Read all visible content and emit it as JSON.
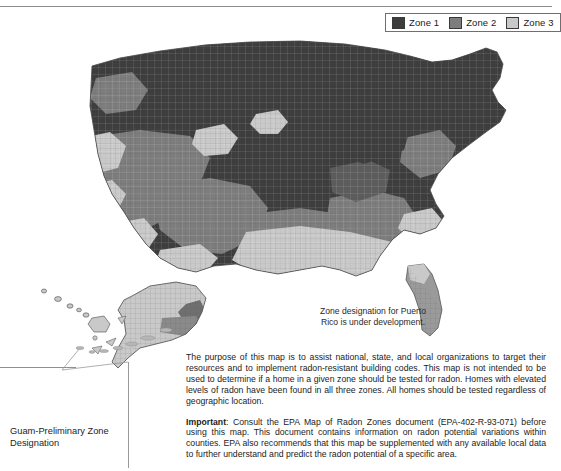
{
  "document": {
    "title": "EPA Map of Radon Zones"
  },
  "legend": {
    "items": [
      {
        "label": "Zone 1",
        "color": "#3d3d3d",
        "name": "zone-1"
      },
      {
        "label": "Zone 2",
        "color": "#7d7d7d",
        "name": "zone-2"
      },
      {
        "label": "Zone 3",
        "color": "#c9c9c9",
        "name": "zone-3"
      }
    ]
  },
  "notes": {
    "puerto_rico": "Zone designation for Puerto Rico is under development.",
    "guam_caption": "Guam-Preliminary Zone Designation"
  },
  "body": {
    "purpose": "The purpose of this map is to assist national, state, and local organizations to target their resources and to implement radon-resistant building codes. This map is not intended to be used to determine if a home in a given zone should be tested for radon. Homes with elevated levels of radon have been found in all three zones. All homes should be tested regardless of geographic location.",
    "important_label": "Important",
    "important_text": ": Consult the EPA Map of Radon Zones document (EPA-402-R-93-071) before using this map. This document contains information on radon potential variations within counties. EPA also recommends that this map be supplemented with any available local data to further understand and predict the radon potential of a specific area."
  },
  "map": {
    "regions": [
      {
        "name": "continental-us",
        "dominant_zone": "Zone 1"
      },
      {
        "name": "alaska-inset",
        "dominant_zone": "Zone 3"
      },
      {
        "name": "hawaii-inset",
        "dominant_zone": "Zone 3"
      },
      {
        "name": "guam-inset",
        "dominant_zone": "Zone 2"
      }
    ]
  },
  "colors": {
    "zone1": "#3d3d3d",
    "zone2": "#7d7d7d",
    "zone3": "#c9c9c9",
    "outline": "#555555",
    "rule": "#8d8d8d",
    "text": "#1c1c1c",
    "background": "#ffffff"
  }
}
